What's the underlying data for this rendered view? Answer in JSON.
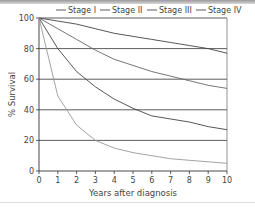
{
  "chart_data": {
    "type": "line",
    "title": "",
    "xlabel": "Years after diagnosis",
    "ylabel": "% Survival",
    "xlim": [
      0,
      10
    ],
    "ylim": [
      0,
      100
    ],
    "x_ticks": [
      "0",
      "1",
      "2",
      "3",
      "4",
      "5",
      "6",
      "7",
      "8",
      "9",
      "10"
    ],
    "y_ticks": [
      "0",
      "20",
      "40",
      "60",
      "80",
      "100"
    ],
    "grid": "horizontal",
    "legend_position": "top",
    "x": [
      0,
      1,
      2,
      3,
      4,
      5,
      6,
      7,
      8,
      9,
      10
    ],
    "series": [
      {
        "name": "Stage I",
        "values": [
          100,
          98,
          96,
          93,
          90,
          88,
          86,
          84,
          82,
          80,
          77
        ]
      },
      {
        "name": "Stage II",
        "values": [
          100,
          93,
          86,
          79,
          73,
          69,
          65,
          62,
          59,
          56,
          54
        ]
      },
      {
        "name": "Stage III",
        "values": [
          100,
          80,
          65,
          55,
          47,
          41,
          36,
          34,
          32,
          29,
          27
        ]
      },
      {
        "name": "Stage IV",
        "values": [
          100,
          49,
          30,
          20,
          15,
          12,
          10,
          8,
          7,
          6,
          5
        ]
      }
    ]
  },
  "legend": {
    "items": [
      "Stage I",
      "Stage II",
      "Stage III",
      "Stage IV"
    ]
  },
  "axes": {
    "xlabel": "Years after diagnosis",
    "ylabel": "% Survival"
  }
}
